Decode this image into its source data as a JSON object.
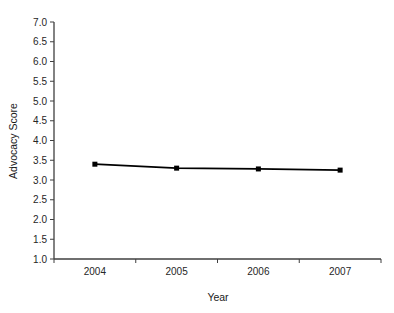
{
  "chart_data": {
    "type": "line",
    "title": "",
    "xlabel": "Year",
    "ylabel": "Advocacy Score",
    "categories": [
      "2004",
      "2005",
      "2006",
      "2007"
    ],
    "series": [
      {
        "name": "Advocacy Score",
        "values": [
          3.4,
          3.3,
          3.28,
          3.25
        ],
        "color": "#000000",
        "marker": "square"
      }
    ],
    "ylim": [
      1.0,
      7.0
    ],
    "ytick_step": 0.5,
    "ytick_labels": [
      "1.0",
      "1.5",
      "2.0",
      "2.5",
      "3.0",
      "3.5",
      "4.0",
      "4.5",
      "5.0",
      "5.5",
      "6.0",
      "6.5",
      "7.0"
    ],
    "grid": false,
    "legend": "none",
    "axis_color": "#3f3f3f",
    "background": "#ffffff"
  }
}
